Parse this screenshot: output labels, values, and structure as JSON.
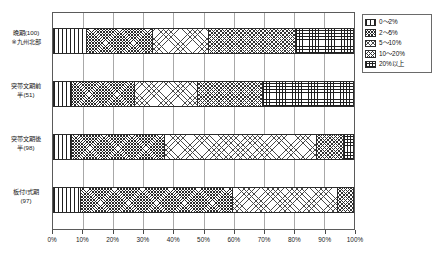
{
  "chart_data": {
    "type": "bar",
    "orientation": "horizontal",
    "stacked": true,
    "normalized_percent": true,
    "title": "",
    "xlabel": "",
    "ylabel": "",
    "xlim": [
      0,
      100
    ],
    "xticks": [
      "0%",
      "10%",
      "20%",
      "30%",
      "40%",
      "50%",
      "60%",
      "70%",
      "80%",
      "90%",
      "100%"
    ],
    "grid": true,
    "legend_position": "right",
    "categories": [
      "晩期(100)\n※九州北部",
      "突帯文期前\n半(51)",
      "突帯文期後\n半(98)",
      "板付I式期\n(97)"
    ],
    "series": [
      {
        "name": "0〜2%",
        "pattern": "vertical-lines",
        "values": [
          11,
          6,
          6,
          9
        ]
      },
      {
        "name": "2〜5%",
        "pattern": "dense-crosshatch",
        "values": [
          22,
          21,
          31,
          51
        ]
      },
      {
        "name": "5〜10%",
        "pattern": "light-dots",
        "values": [
          19,
          21,
          51,
          35
        ]
      },
      {
        "name": "10〜20%",
        "pattern": "medium-crosshatch",
        "values": [
          29,
          22,
          9,
          5
        ]
      },
      {
        "name": "20%以上",
        "pattern": "dense-grid",
        "values": [
          19,
          30,
          3,
          0
        ]
      }
    ]
  },
  "legend": {
    "items": [
      {
        "label": "0〜2%"
      },
      {
        "label": "2〜5%"
      },
      {
        "label": "5〜10%"
      },
      {
        "label": "10〜20%"
      },
      {
        "label": "20%以上"
      }
    ]
  },
  "colors": {
    "axis": "#5a5a5a",
    "grid": "#a8a8a8",
    "bar_border": "#2b2b2b",
    "text": "#1a1a1a"
  }
}
